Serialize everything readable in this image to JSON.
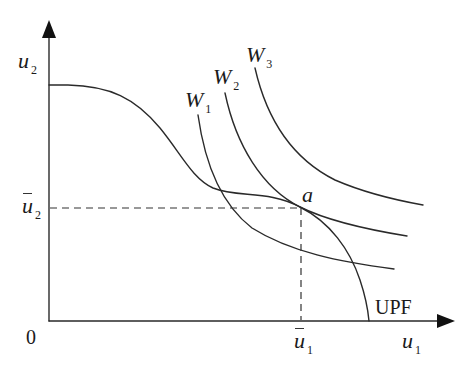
{
  "diagram": {
    "type": "utility possibility frontier with social welfare indifference curves",
    "axes": {
      "y_label": "u",
      "y_label_sub": "2",
      "x_label": "u",
      "x_label_sub": "1",
      "origin_label": "0"
    },
    "frontier": {
      "label": "UPF"
    },
    "welfare_curves": [
      {
        "label": "W",
        "sub": "1"
      },
      {
        "label": "W",
        "sub": "2"
      },
      {
        "label": "W",
        "sub": "3"
      }
    ],
    "tangency_point": {
      "label": "a"
    },
    "reference_levels": {
      "u2_bar": {
        "label": "u",
        "sub": "2"
      },
      "u1_bar": {
        "label": "u",
        "sub": "1"
      }
    },
    "colors": {
      "line": "#2a2a2a",
      "background": "#ffffff"
    }
  }
}
